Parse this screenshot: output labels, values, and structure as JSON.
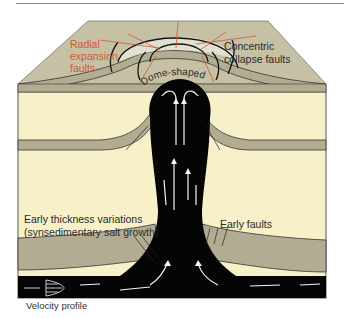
{
  "figure": {
    "labels": {
      "radial": [
        "Radial",
        "expansion",
        "faults"
      ],
      "concentric": [
        "Concentric",
        "collapse faults"
      ],
      "dome": "Dome-shaped",
      "early_thickness": [
        "Early thickness variations",
        "(synsedimentary salt growth)"
      ],
      "early_faults": "Early faults",
      "velocity_profile": "Velocity profile"
    },
    "colors": {
      "overburden": "#f7f0c8",
      "layer_gray": "#b2ad92",
      "top_surface": "#c6c1a4",
      "salt": "#050505",
      "radial_faults": "#d2573a",
      "flow_arrows": "#ffffff"
    }
  }
}
